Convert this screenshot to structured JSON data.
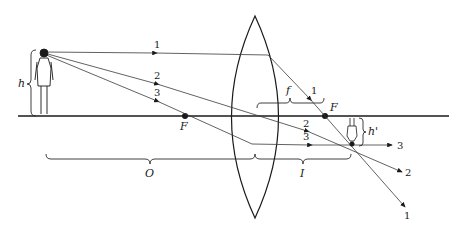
{
  "diagram": {
    "type": "thin convex lens ray diagram (real inverted image)",
    "labels": {
      "object_height": "h",
      "image_height": "h'",
      "focal_length": "f",
      "object_distance": "O",
      "image_distance": "I",
      "focal_point_left": "F",
      "focal_point_right": "F"
    },
    "rays": [
      {
        "id": "1",
        "label_top": "1",
        "label_after_lens": "1",
        "label_end": "1",
        "description": "parallel to axis, refracts through right focal point"
      },
      {
        "id": "2",
        "label_top": "2",
        "label_after_lens": "2",
        "label_end": "2",
        "description": "through lens center, undeviated"
      },
      {
        "id": "3",
        "label_top": "3",
        "label_after_lens": "3",
        "label_end": "3",
        "description": "through left focal point, emerges parallel"
      }
    ],
    "colors": {
      "line": "#1a1a1a",
      "ray": "#3a3a3a",
      "background": "#ffffff"
    }
  }
}
